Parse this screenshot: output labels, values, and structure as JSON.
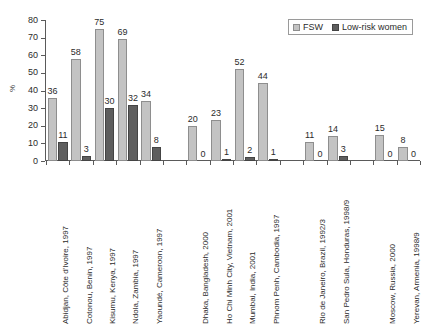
{
  "chart_data": {
    "type": "bar",
    "title": "",
    "subtitle": "",
    "xlabel": "",
    "ylabel": "%",
    "ylim": [
      0,
      80
    ],
    "ytick_labels": [
      "80",
      "70",
      "60",
      "50",
      "40",
      "30",
      "20",
      "10",
      "0"
    ],
    "ytick_values": [
      80,
      70,
      60,
      50,
      40,
      30,
      20,
      10,
      0
    ],
    "grid": false,
    "legend_position": "top-right",
    "categories": [
      "Abidjan, Côte d'Ivoire, 1997",
      "Cotonou, Benin, 1997",
      "Kisumu, Kenya, 1997",
      "Ndola, Zambia, 1997",
      "Yaoundé, Cameroon, 1997",
      "Dhaka, Bangladesh, 2000",
      "Ho Chi Minh City, Vietnam, 2001",
      "Mumbai, India, 2001",
      "Phnom Penh, Cambodia, 1997",
      "Rio de Janeiro, Brazil, 1992/3",
      "San Pedro Sula, Honduras, 1998/9",
      "Moscow, Russia, 2000",
      "Yerevan, Armenia, 1998/9"
    ],
    "series": [
      {
        "name": "FSW",
        "color": "#c3c3c3",
        "values": [
          36,
          58,
          75,
          69,
          34,
          20,
          23,
          52,
          44,
          11,
          14,
          15,
          8
        ]
      },
      {
        "name": "Low-risk women",
        "color": "#5e5e5e",
        "values": [
          11,
          3,
          30,
          32,
          8,
          0,
          1,
          2,
          1,
          0,
          3,
          0,
          0
        ]
      }
    ],
    "groups": [
      {
        "start": 0,
        "count": 5
      },
      {
        "start": 5,
        "count": 4
      },
      {
        "start": 9,
        "count": 2
      },
      {
        "start": 11,
        "count": 2
      }
    ]
  },
  "legend": {
    "items": [
      {
        "label": "FSW",
        "swatch": "light-gray-swatch"
      },
      {
        "label": "Low-risk women",
        "swatch": "dark-gray-swatch"
      }
    ]
  }
}
